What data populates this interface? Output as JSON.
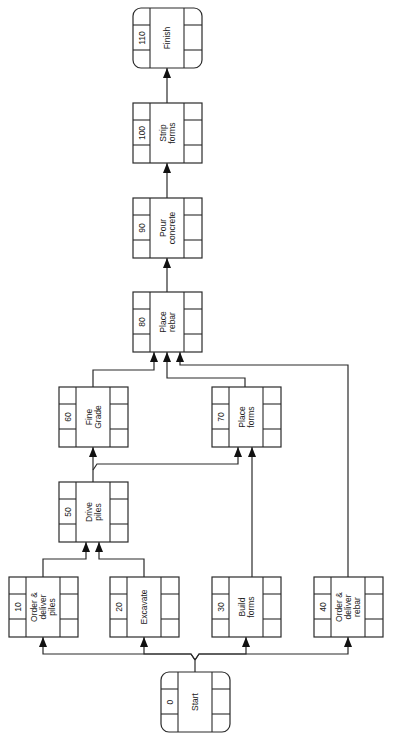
{
  "diagram": {
    "type": "precedence-network",
    "orientation": "rotated-90-ccw",
    "nodes": [
      {
        "id": "0",
        "name": "Start",
        "lines": [
          "Start"
        ],
        "milestone": true
      },
      {
        "id": "10",
        "name": "Order & deliver piles",
        "lines": [
          "Order &",
          "deliver",
          "piles"
        ],
        "milestone": false
      },
      {
        "id": "20",
        "name": "Excavate",
        "lines": [
          "Excavate"
        ],
        "milestone": false
      },
      {
        "id": "30",
        "name": "Build forms",
        "lines": [
          "Build",
          "forms"
        ],
        "milestone": false
      },
      {
        "id": "40",
        "name": "Order & deliver rebar",
        "lines": [
          "Order &",
          "deliver",
          "rebar"
        ],
        "milestone": false
      },
      {
        "id": "50",
        "name": "Drive piles",
        "lines": [
          "Drive",
          "piles"
        ],
        "milestone": false
      },
      {
        "id": "60",
        "name": "Fine Grade",
        "lines": [
          "Fine",
          "Grade"
        ],
        "milestone": false
      },
      {
        "id": "70",
        "name": "Place forms",
        "lines": [
          "Place",
          "forms"
        ],
        "milestone": false
      },
      {
        "id": "80",
        "name": "Place rebar",
        "lines": [
          "Place",
          "rebar"
        ],
        "milestone": false
      },
      {
        "id": "90",
        "name": "Pour concrete",
        "lines": [
          "Pour",
          "concrete"
        ],
        "milestone": false
      },
      {
        "id": "100",
        "name": "Strip forms",
        "lines": [
          "Strip",
          "forms"
        ],
        "milestone": false
      },
      {
        "id": "110",
        "name": "Finish",
        "lines": [
          "Finish"
        ],
        "milestone": true
      }
    ],
    "edges": [
      {
        "from": "0",
        "to": "10"
      },
      {
        "from": "0",
        "to": "20"
      },
      {
        "from": "0",
        "to": "30"
      },
      {
        "from": "0",
        "to": "40"
      },
      {
        "from": "10",
        "to": "50"
      },
      {
        "from": "20",
        "to": "50"
      },
      {
        "from": "50",
        "to": "60"
      },
      {
        "from": "50",
        "to": "70"
      },
      {
        "from": "30",
        "to": "70"
      },
      {
        "from": "60",
        "to": "80"
      },
      {
        "from": "70",
        "to": "80"
      },
      {
        "from": "40",
        "to": "80"
      },
      {
        "from": "80",
        "to": "90"
      },
      {
        "from": "90",
        "to": "100"
      },
      {
        "from": "100",
        "to": "110"
      }
    ]
  }
}
